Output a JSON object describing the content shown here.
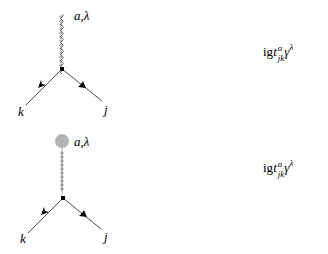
{
  "diagrams": [
    {
      "id": "gluon-vertex",
      "boson_label": "a,λ",
      "in_label": "k",
      "out_label": "j",
      "has_blob": false,
      "rule": {
        "prefix": "ig",
        "t": "t",
        "sup": "a",
        "sub": "jk",
        "gamma": "γ",
        "gamma_sup": "λ"
      }
    },
    {
      "id": "background-gluon-vertex",
      "boson_label": "a,λ",
      "in_label": "k",
      "out_label": "j",
      "has_blob": true,
      "blob_color": "#b3b3b3",
      "rule": {
        "prefix": "ig",
        "t": "t",
        "sup": "a",
        "sub": "jk",
        "gamma": "γ",
        "gamma_sup": "λ"
      }
    }
  ]
}
